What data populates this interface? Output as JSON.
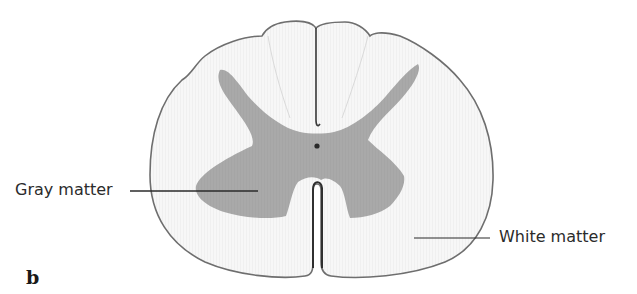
{
  "figure": {
    "panel_letter": "b",
    "labels": {
      "gray_matter": "Gray matter",
      "white_matter": "White matter"
    },
    "colors": {
      "white_matter_fill": "#f4f4f4",
      "gray_matter_fill": "#a8a8a8",
      "outline": "#6e6e6e",
      "leader_line": "#2b2b2b",
      "text": "#2b2b2b"
    }
  }
}
